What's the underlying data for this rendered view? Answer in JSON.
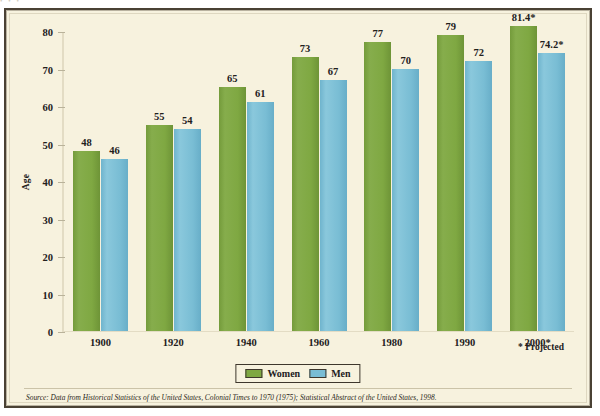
{
  "figure": {
    "top_sliver_text": "• • •",
    "y_axis_title": "Age",
    "projected_note": "* Projected",
    "source_text": "Source: Data from Historical Statistics of the United States, Colonial Times to 1970 (1975); Statistical Abstract of the United States, 1998."
  },
  "legend": {
    "items": [
      {
        "label": "Women",
        "color": "#7fa842"
      },
      {
        "label": "Men",
        "color": "#79bdd4"
      }
    ]
  },
  "colors": {
    "women": "#7fa842",
    "men": "#79bdd4",
    "background": "#f7f2de",
    "frame": "#4a4134",
    "text": "#22201c"
  },
  "chart_data": {
    "type": "bar",
    "title": "",
    "xlabel": "",
    "ylabel": "Age",
    "ylim": [
      0,
      80
    ],
    "yticks": [
      0,
      10,
      20,
      30,
      40,
      50,
      60,
      70,
      80
    ],
    "grid": false,
    "legend_position": "bottom-center",
    "categories": [
      "1900",
      "1920",
      "1940",
      "1960",
      "1980",
      "1990",
      "2000*"
    ],
    "series": [
      {
        "name": "Women",
        "color": "#7fa842",
        "values": [
          48,
          55,
          65,
          73,
          77,
          79,
          81.4
        ],
        "labels": [
          "48",
          "55",
          "65",
          "73",
          "77",
          "79",
          "81.4*"
        ]
      },
      {
        "name": "Men",
        "color": "#79bdd4",
        "values": [
          46,
          54,
          61,
          67,
          70,
          72,
          74.2
        ],
        "labels": [
          "46",
          "54",
          "61",
          "67",
          "70",
          "72",
          "74.2*"
        ]
      }
    ],
    "annotations": [
      "* Projected"
    ]
  }
}
